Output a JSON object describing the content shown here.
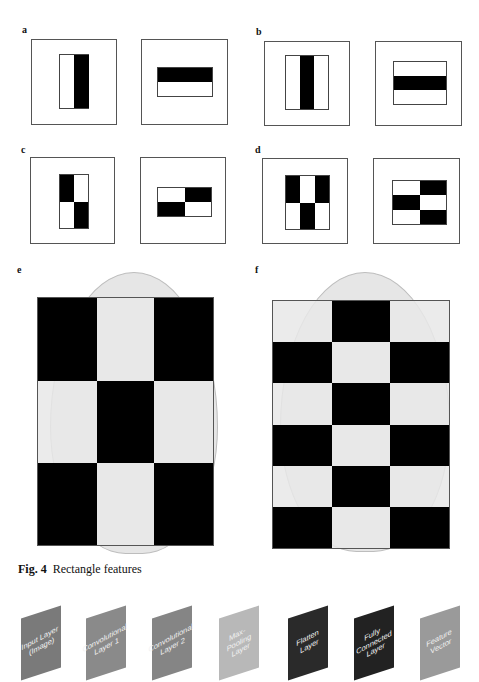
{
  "panels": {
    "a": {
      "label": "a"
    },
    "b": {
      "label": "b"
    },
    "c": {
      "label": "c"
    },
    "d": {
      "label": "d"
    },
    "e": {
      "label": "e",
      "grid": {
        "cols": 3,
        "rows": 3,
        "pattern": [
          "b",
          "w",
          "b",
          "w",
          "b",
          "w",
          "b",
          "w",
          "b"
        ]
      }
    },
    "f": {
      "label": "f",
      "grid": {
        "cols": 3,
        "rows": 6,
        "pattern": [
          "w",
          "b",
          "w",
          "b",
          "w",
          "b",
          "w",
          "b",
          "w",
          "b",
          "w",
          "b",
          "w",
          "b",
          "w",
          "b",
          "w",
          "b"
        ]
      }
    }
  },
  "caption": {
    "fig": "Fig. 4",
    "text": "Rectangle features"
  },
  "layers": [
    {
      "label": "Input Layer (Image)",
      "line1": "Input Layer",
      "line2": "(Image)",
      "color": "#7a7a7a"
    },
    {
      "label": "Convolutional Layer 1",
      "line1": "Convolutional",
      "line2": "Layer 1",
      "color": "#8a8a8a"
    },
    {
      "label": "Convolutional Layer 2",
      "line1": "Convolutional",
      "line2": "Layer 2",
      "color": "#858585"
    },
    {
      "label": "Max-Pooling Layer",
      "line1": "Max-Pooling",
      "line2": "Layer",
      "color": "#b8b8b8"
    },
    {
      "label": "Flatten Layer",
      "line1": "Flatten",
      "line2": "Layer",
      "color": "#2a2a2a"
    },
    {
      "label": "Fully Connected Layer",
      "line1": "Fully Connected",
      "line2": "Layer",
      "color": "#222222"
    },
    {
      "label": "Feature Vector",
      "line1": "Feature",
      "line2": "Vector",
      "color": "#9a9a9a"
    }
  ]
}
